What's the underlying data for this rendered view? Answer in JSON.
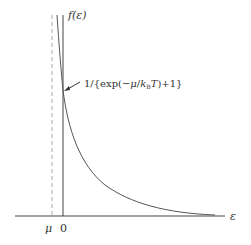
{
  "diagram": {
    "y_axis_label": "f(ε)",
    "x_axis_label": "ε",
    "origin_label": "0",
    "mu_label": "μ",
    "annotation": "1/{exp(−μ/k₀T)+1}",
    "annotation_parts": {
      "prefix": "1/{exp(−",
      "mu": "μ",
      "slash": "/",
      "k": "k",
      "sub": "B",
      "T": "T",
      "suffix": ")+1}"
    },
    "caption": "",
    "colors": {
      "axis": "#444444",
      "curve": "#555555",
      "dashed": "#aaaaaa",
      "text": "#333333"
    }
  }
}
